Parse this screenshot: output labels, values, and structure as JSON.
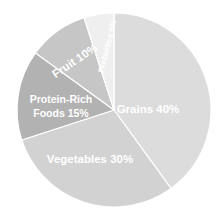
{
  "chart_data": {
    "type": "pie",
    "title": "",
    "subtitle": "",
    "xlabel": "",
    "ylabel": "",
    "legend_position": "none",
    "grid": false,
    "labels_inside": true,
    "start_angle_deg": 0,
    "direction": "clockwise",
    "categories": [
      "Grains",
      "Vegetables",
      "Protein-Rich Foods",
      "Fruit",
      "Probiotics"
    ],
    "values": [
      40,
      30,
      15,
      10,
      5
    ],
    "value_unit": "%",
    "colors": [
      "#dcdcdc",
      "#d2d2d2",
      "#b2b2b2",
      "#c6c6c6",
      "#efefef"
    ],
    "slices": [
      {
        "name": "Grains",
        "value": 40,
        "label": "Grains 40%",
        "color": "#dcdcdc",
        "start_deg": 0,
        "end_deg": 144,
        "label_x": 148,
        "label_y": 113,
        "label_rotation": 0,
        "label_size": "large",
        "anchor": "middle"
      },
      {
        "name": "Vegetables",
        "value": 30,
        "label": "Vegetables 30%",
        "color": "#d2d2d2",
        "start_deg": 144,
        "end_deg": 252,
        "label_x": 90,
        "label_y": 163,
        "label_rotation": 0,
        "label_size": "large",
        "anchor": "middle"
      },
      {
        "name": "Protein-Rich Foods",
        "value": 15,
        "label_line1": "Protein-Rich",
        "label_line2": "Foods 15%",
        "color": "#b2b2b2",
        "start_deg": 252,
        "end_deg": 306,
        "label_x": 61,
        "label_y": 103,
        "label_rotation": 0,
        "label_size": "medium",
        "anchor": "middle"
      },
      {
        "name": "Fruit",
        "value": 10,
        "label": "Fruit 10%",
        "color": "#c6c6c6",
        "start_deg": 306,
        "end_deg": 342,
        "label_x": 77,
        "label_y": 64,
        "label_rotation": 34,
        "label_size": "large",
        "anchor": "middle"
      },
      {
        "name": "Probiotics",
        "value": 5,
        "label": "Probiotics 5%",
        "color": "#efefef",
        "start_deg": 342,
        "end_deg": 360,
        "label_x": 110,
        "label_y": 47,
        "label_rotation": 76,
        "label_size": "small",
        "anchor": "middle"
      }
    ],
    "geometry": {
      "center_x": 114,
      "center_y": 110,
      "radius": 97
    },
    "background_color": "#ffffff",
    "label_color": "#ffffff"
  }
}
